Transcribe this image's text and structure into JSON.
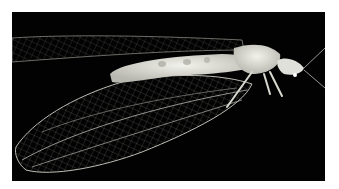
{
  "image": {
    "subject": "Green lacewing insect photographed against a black background",
    "background_color": "#020202",
    "border_color": "#ffffff",
    "insect_color": "#e6e6e0",
    "wing_vein_color": "#bfbfb8"
  }
}
